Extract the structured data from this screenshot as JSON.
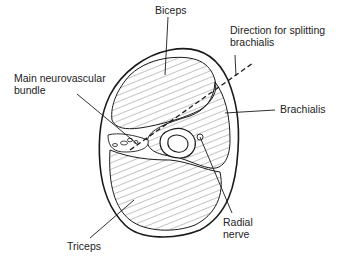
{
  "diagram": {
    "type": "anatomical cross-section",
    "colors": {
      "line": "#1a1a1a",
      "hatch": "#555555",
      "background": "#ffffff"
    },
    "labels": {
      "biceps": "Biceps",
      "direction": "Direction for splitting\nbrachialis",
      "neurovascular": "Main neurovascular\nbundle",
      "brachialis": "Brachialis",
      "radial_nerve": "Radial\nnerve",
      "triceps": "Triceps"
    }
  }
}
